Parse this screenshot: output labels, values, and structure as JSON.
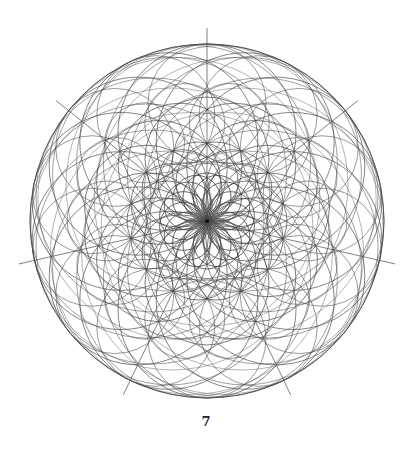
{
  "figure": {
    "caption": "7",
    "symmetry": 7,
    "center": [
      207,
      221
    ],
    "outer_radius": 177,
    "ray_length": 193,
    "ray_start_angle_deg": -90,
    "stroke_color": "#4a4a4a",
    "families": [
      {
        "d": 88,
        "r": 89,
        "phase": 0,
        "width": 0.8,
        "opacity": 0.85
      },
      {
        "d": 88,
        "r": 89,
        "phase": 0.5,
        "width": 0.8,
        "opacity": 0.85
      },
      {
        "d": 118,
        "r": 59,
        "phase": 0,
        "width": 0.7,
        "opacity": 0.8
      },
      {
        "d": 118,
        "r": 59,
        "phase": 0.5,
        "width": 0.7,
        "opacity": 0.8
      },
      {
        "d": 60,
        "r": 117,
        "phase": 0.25,
        "width": 0.7,
        "opacity": 0.75
      },
      {
        "d": 60,
        "r": 117,
        "phase": 0.75,
        "width": 0.7,
        "opacity": 0.75
      },
      {
        "d": 62,
        "r": 62,
        "phase": 0,
        "width": 0.8,
        "opacity": 0.9
      },
      {
        "d": 62,
        "r": 62,
        "phase": 0.5,
        "width": 0.8,
        "opacity": 0.9
      },
      {
        "d": 40,
        "r": 40,
        "phase": 0.25,
        "width": 0.8,
        "opacity": 0.9
      },
      {
        "d": 40,
        "r": 40,
        "phase": 0.75,
        "width": 0.8,
        "opacity": 0.9
      },
      {
        "d": 24,
        "r": 24,
        "phase": 0,
        "width": 0.9,
        "opacity": 0.95
      },
      {
        "d": 24,
        "r": 24,
        "phase": 0.5,
        "width": 0.9,
        "opacity": 0.95
      },
      {
        "d": 36,
        "r": 141,
        "phase": 0,
        "width": 0.6,
        "opacity": 0.7
      },
      {
        "d": 100,
        "r": 40,
        "phase": 0.25,
        "width": 0.7,
        "opacity": 0.8
      },
      {
        "d": 100,
        "r": 40,
        "phase": 0.75,
        "width": 0.7,
        "opacity": 0.8
      }
    ]
  }
}
